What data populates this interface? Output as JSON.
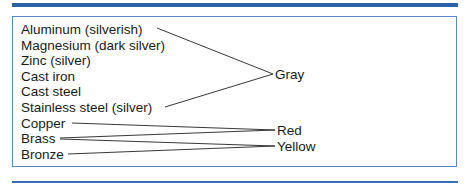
{
  "diagram": {
    "metals": [
      {
        "label": "Aluminum (silverish)",
        "x": 21,
        "y": 22
      },
      {
        "label": "Magnesium (dark silver)",
        "x": 21,
        "y": 38
      },
      {
        "label": "Zinc (silver)",
        "x": 21,
        "y": 53
      },
      {
        "label": "Cast iron",
        "x": 21,
        "y": 69
      },
      {
        "label": "Cast steel",
        "x": 21,
        "y": 84
      },
      {
        "label": "Stainless steel (silver)",
        "x": 21,
        "y": 100
      },
      {
        "label": "Copper",
        "x": 21,
        "y": 116
      },
      {
        "label": "Brass",
        "x": 21,
        "y": 131
      },
      {
        "label": "Bronze",
        "x": 21,
        "y": 147
      }
    ],
    "colors": [
      {
        "label": "Gray",
        "x": 275,
        "y": 67
      },
      {
        "label": "Red",
        "x": 277,
        "y": 123
      },
      {
        "label": "Yellow",
        "x": 277,
        "y": 139
      }
    ],
    "connections": [
      {
        "from": "Aluminum (silverish)",
        "to": "Gray"
      },
      {
        "from": "Stainless steel (silver)",
        "to": "Gray"
      },
      {
        "from": "Copper",
        "to": "Red"
      },
      {
        "from": "Brass",
        "to": "Red"
      },
      {
        "from": "Brass",
        "to": "Yellow"
      },
      {
        "from": "Bronze",
        "to": "Yellow"
      }
    ],
    "accent_color": "#2b63a8"
  }
}
